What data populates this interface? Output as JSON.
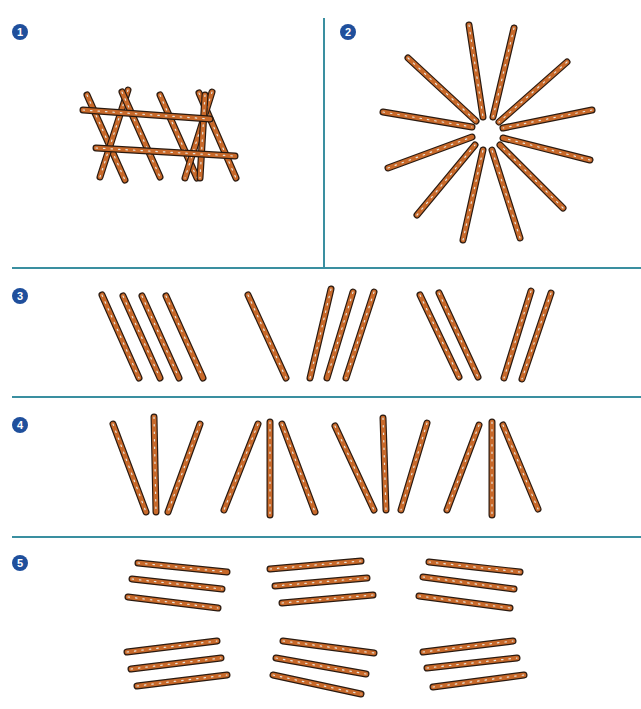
{
  "colors": {
    "divider": "#3a8fa0",
    "badge": "#1f4f9c",
    "stick_fill": "#c8692a",
    "stick_outline": "#2a1a10",
    "stick_speckle": "#e8e4dc"
  },
  "panels": [
    {
      "number": "1",
      "description": "fence / ladder arrangement of pretzel sticks",
      "sticks": [
        [
          87,
          95,
          125,
          180
        ],
        [
          128,
          90,
          100,
          177
        ],
        [
          122,
          92,
          160,
          177
        ],
        [
          160,
          95,
          197,
          178
        ],
        [
          199,
          93,
          236,
          178
        ],
        [
          212,
          92,
          185,
          178
        ],
        [
          205,
          95,
          200,
          178
        ],
        [
          83,
          110,
          210,
          119
        ],
        [
          96,
          148,
          235,
          156
        ]
      ]
    },
    {
      "number": "2",
      "description": "star / sunburst arrangement of 12 pretzel sticks",
      "sticks": [
        [
          469,
          25,
          483,
          117
        ],
        [
          514,
          28,
          493,
          117
        ],
        [
          408,
          58,
          476,
          121
        ],
        [
          567,
          62,
          499,
          122
        ],
        [
          383,
          112,
          472,
          127
        ],
        [
          592,
          110,
          503,
          128
        ],
        [
          388,
          168,
          472,
          137
        ],
        [
          590,
          160,
          503,
          138
        ],
        [
          417,
          215,
          475,
          145
        ],
        [
          563,
          208,
          500,
          145
        ],
        [
          463,
          240,
          483,
          150
        ],
        [
          520,
          238,
          492,
          150
        ]
      ]
    },
    {
      "number": "3",
      "description": "groups of leaning pretzel sticks",
      "sticks": [
        [
          102,
          295,
          139,
          378
        ],
        [
          123,
          296,
          160,
          378
        ],
        [
          142,
          296,
          179,
          378
        ],
        [
          166,
          296,
          203,
          378
        ],
        [
          248,
          295,
          286,
          378
        ],
        [
          331,
          289,
          310,
          378
        ],
        [
          353,
          292,
          327,
          378
        ],
        [
          374,
          292,
          346,
          378
        ],
        [
          420,
          295,
          459,
          377
        ],
        [
          439,
          293,
          478,
          377
        ],
        [
          531,
          291,
          504,
          378
        ],
        [
          551,
          293,
          522,
          379
        ]
      ]
    },
    {
      "number": "4",
      "description": "groups of three fanned pretzel sticks",
      "sticks": [
        [
          113,
          424,
          146,
          512
        ],
        [
          154,
          417,
          156,
          512
        ],
        [
          200,
          424,
          168,
          512
        ],
        [
          258,
          424,
          224,
          510
        ],
        [
          270,
          422,
          270,
          515
        ],
        [
          282,
          424,
          315,
          512
        ],
        [
          335,
          426,
          374,
          510
        ],
        [
          383,
          418,
          386,
          510
        ],
        [
          427,
          423,
          401,
          510
        ],
        [
          479,
          425,
          447,
          510
        ],
        [
          492,
          422,
          492,
          515
        ],
        [
          503,
          425,
          538,
          509
        ]
      ]
    },
    {
      "number": "5",
      "description": "stacks of three nearly horizontal pretzel sticks",
      "sticks": [
        [
          138,
          563,
          227,
          572
        ],
        [
          132,
          579,
          222,
          589
        ],
        [
          128,
          597,
          218,
          608
        ],
        [
          270,
          569,
          361,
          561
        ],
        [
          275,
          586,
          367,
          578
        ],
        [
          282,
          603,
          373,
          595
        ],
        [
          429,
          562,
          520,
          572
        ],
        [
          423,
          577,
          514,
          589
        ],
        [
          419,
          596,
          510,
          608
        ],
        [
          127,
          652,
          217,
          641
        ],
        [
          131,
          669,
          221,
          658
        ],
        [
          137,
          686,
          227,
          675
        ],
        [
          283,
          641,
          374,
          653
        ],
        [
          276,
          658,
          366,
          674
        ],
        [
          273,
          675,
          361,
          694
        ],
        [
          423,
          652,
          513,
          641
        ],
        [
          427,
          668,
          517,
          658
        ],
        [
          433,
          687,
          524,
          675
        ]
      ]
    }
  ]
}
